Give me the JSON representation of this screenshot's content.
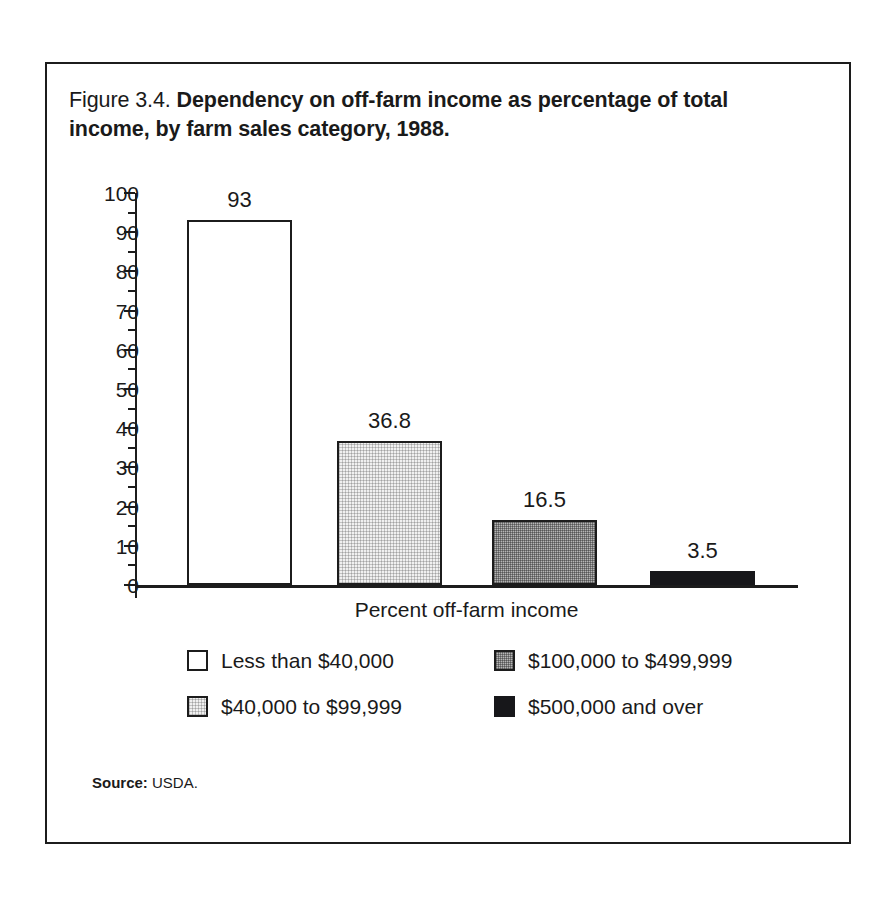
{
  "figure": {
    "title_lead": "Figure 3.4.",
    "title_bold": "Dependency on off-farm income as percentage of total income, by farm sales category, 1988."
  },
  "source": {
    "label": "Source:",
    "value": "USDA."
  },
  "chart_data": {
    "type": "bar",
    "title": "Figure 3.4. Dependency on off-farm income as percentage of total income, by farm sales category, 1988.",
    "xlabel": "Percent off-farm income",
    "ylabel": "",
    "ylim": [
      0,
      100
    ],
    "grid": false,
    "legend_position": "below-axis",
    "categories": [
      "Less than $40,000",
      "$40,000 to $99,999",
      "$100,000 to $499,999",
      "$500,000 and over"
    ],
    "values": [
      93,
      36.8,
      16.5,
      3.5
    ],
    "value_labels": [
      "93",
      "36.8",
      "16.5",
      "3.5"
    ],
    "bar_fills": [
      "white",
      "light-gray",
      "medium-gray",
      "black"
    ],
    "bar_colors": [
      "#ffffff",
      "#f0f0f0",
      "#b6b6b6",
      "#17171a"
    ],
    "bar_edge_color": "#1c1c1c",
    "ytick_labels": [
      "100",
      "90",
      "80",
      "70",
      "60",
      "50",
      "40",
      "30",
      "20",
      "10",
      "0"
    ],
    "ytick_values": [
      100,
      90,
      80,
      70,
      60,
      50,
      40,
      30,
      20,
      10,
      0
    ],
    "yminor_ticks": [
      95,
      85,
      75,
      65,
      55,
      45,
      35,
      25,
      15,
      5
    ]
  },
  "legend": {
    "items": [
      {
        "label": "Less than $40,000",
        "fill": "fill-white",
        "swatch_name": "legend-swatch-less-than-40000"
      },
      {
        "label": "$100,000 to $499,999",
        "fill": "fill-mid",
        "swatch_name": "legend-swatch-100000-to-499999"
      },
      {
        "label": "$40,000 to $99,999",
        "fill": "fill-light",
        "swatch_name": "legend-swatch-40000-to-99999"
      },
      {
        "label": "$500,000 and over",
        "fill": "fill-black",
        "swatch_name": "legend-swatch-500000-and-over"
      }
    ]
  }
}
